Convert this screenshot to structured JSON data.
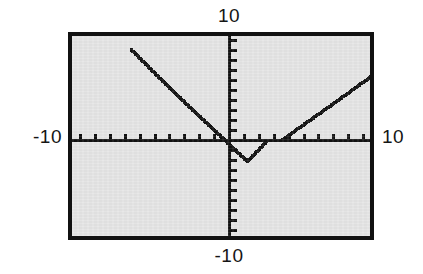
{
  "screen": {
    "kind": "graphing-calculator-viewport",
    "background_color": "#e4e4e4",
    "frame_color": "#111111",
    "plot_color": "#111111"
  },
  "labels": {
    "y_max": "10",
    "y_min": "-10",
    "x_min": "-10",
    "x_max": "10"
  },
  "chart_data": {
    "type": "line",
    "title": "",
    "xlabel": "",
    "ylabel": "",
    "xlim": [
      -10,
      10
    ],
    "ylim": [
      -10,
      10
    ],
    "grid": false,
    "legend": null,
    "axes": {
      "x_axis_visible": true,
      "y_axis_visible": true,
      "x_tick_interval": 1,
      "y_tick_interval": 1,
      "x_tick_count_each_side": 10,
      "y_tick_count_each_side": 10,
      "tick_style": "short-marks-on-axis",
      "x_tick_labels": [
        "-10",
        "10"
      ],
      "y_tick_labels": [
        "-10",
        "10"
      ]
    },
    "rendering": "pixelated-dotted-trace",
    "series": [
      {
        "name": "left-branch",
        "shape": "descending-line",
        "points": [
          {
            "x": -6.6,
            "y": 9.1
          },
          {
            "x": -5.0,
            "y": 6.7
          },
          {
            "x": -3.0,
            "y": 3.8
          },
          {
            "x": -1.0,
            "y": 1.0
          },
          {
            "x": 0.0,
            "y": -0.4
          },
          {
            "x": 1.2,
            "y": -2.1
          },
          {
            "x": 2.5,
            "y": -0.1
          }
        ]
      },
      {
        "name": "right-branch",
        "shape": "ascending-line",
        "points": [
          {
            "x": 3.5,
            "y": 0.0
          },
          {
            "x": 5.0,
            "y": 1.6
          },
          {
            "x": 7.0,
            "y": 3.7
          },
          {
            "x": 9.6,
            "y": 6.5
          }
        ]
      },
      {
        "name": "vertex-flat",
        "shape": "flat-segment-on-x-axis",
        "points": [
          {
            "x": 2.5,
            "y": 0.0
          },
          {
            "x": 3.5,
            "y": 0.0
          }
        ]
      }
    ]
  }
}
